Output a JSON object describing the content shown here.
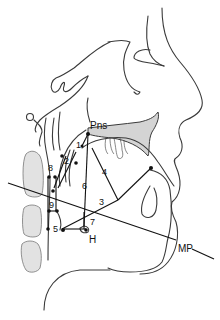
{
  "figure": {
    "type": "cephalometric tracing (lateral head & neck)",
    "labels": {
      "pns": "Pns",
      "hyoid": "H",
      "mandibular_plane": "MP"
    },
    "landmark_numbers": [
      "1",
      "2",
      "3",
      "4",
      "5",
      "6",
      "7",
      "8",
      "9"
    ],
    "colors": {
      "line": "#3a3a3a",
      "reference_line": "#111111",
      "palate_fill": "#d4d4d4",
      "vertebra_fill": "#e2e2e2",
      "background": "#ffffff"
    }
  }
}
